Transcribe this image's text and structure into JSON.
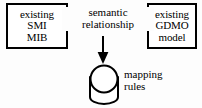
{
  "figure": {
    "background_color": "#fdfdfd",
    "stroke_color": "#000000",
    "text_color": "#000000"
  },
  "left_box": {
    "name": "existing-smi-mib",
    "lines": [
      "existing",
      "SMI",
      "MIB"
    ],
    "line1": "existing",
    "line2": "SMI",
    "line3": "MIB"
  },
  "right_box": {
    "name": "existing-gdmo-model",
    "lines": [
      "existing",
      "GDMO",
      "model"
    ],
    "line1": "existing",
    "line2": "GDMO",
    "line3": "model"
  },
  "relationship": {
    "name": "semantic-relationship",
    "line1": "semantic",
    "line2": "relationship",
    "arrow": "double-headed-horizontal"
  },
  "mapping": {
    "name": "mapping-rules",
    "line1": "mapping",
    "line2": "rules",
    "shape": "cylinder",
    "arrow": "down"
  }
}
